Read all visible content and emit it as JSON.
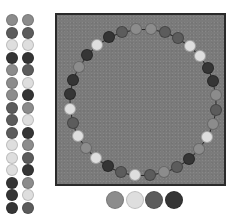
{
  "title": "",
  "colors": {
    "mid": "#8c8c8c",
    "light": "#dedede",
    "dark": "#5c5c5c",
    "darkest": "#353535",
    "board": "#7b7b7b",
    "border": "#2a2a2a"
  },
  "palette_rows": [
    [
      "mid",
      "mid"
    ],
    [
      "dark",
      "dark"
    ],
    [
      "light",
      "light"
    ],
    [
      "darkest",
      "darkest"
    ],
    [
      "mid",
      "dark"
    ],
    [
      "mid",
      "light"
    ],
    [
      "mid",
      "darkest"
    ],
    [
      "dark",
      "mid"
    ],
    [
      "dark",
      "light"
    ],
    [
      "dark",
      "darkest"
    ],
    [
      "light",
      "mid"
    ],
    [
      "light",
      "dark"
    ],
    [
      "light",
      "darkest"
    ],
    [
      "darkest",
      "mid"
    ],
    [
      "darkest",
      "light"
    ],
    [
      "darkest",
      "dark"
    ]
  ],
  "ring": {
    "center_x": 86,
    "center_y": 87,
    "radius": 73,
    "start_angle_deg": -84,
    "dots": [
      "mid",
      "dark",
      "dark",
      "light",
      "light",
      "darkest",
      "darkest",
      "mid",
      "dark",
      "mid",
      "light",
      "mid",
      "darkest",
      "dark",
      "mid",
      "dark",
      "light",
      "dark",
      "darkest",
      "light",
      "mid",
      "light",
      "dark",
      "light",
      "darkest",
      "darkest",
      "mid",
      "darkest",
      "light",
      "darkest",
      "dark",
      "mid"
    ]
  },
  "choices": [
    "mid",
    "light",
    "dark",
    "darkest"
  ]
}
